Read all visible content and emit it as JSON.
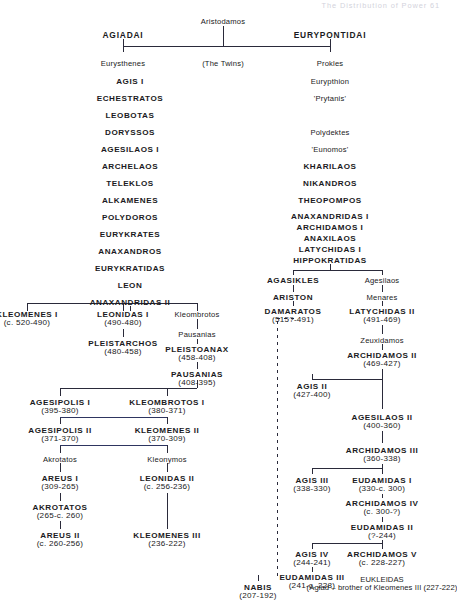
{
  "page": {
    "header": "The Distribution of Power   61"
  },
  "colors": {
    "ink": "#1a1a22",
    "line": "#2a2a3a",
    "blue_line": "#2e3560",
    "header": "#d3d3dc",
    "background": "#ffffff"
  },
  "nodes": [
    {
      "id": "aristodamos",
      "name": "Aristodamos",
      "dates": "",
      "x": 223,
      "y": 18,
      "style": "small"
    },
    {
      "id": "agiadai",
      "name": "AGIADAI",
      "dates": "",
      "x": 123,
      "y": 31,
      "style": "hdr"
    },
    {
      "id": "eurypontidai",
      "name": "EURYPONTIDAI",
      "dates": "",
      "x": 330,
      "y": 31,
      "style": "hdr"
    },
    {
      "id": "eurysthenes",
      "name": "Eurysthenes",
      "dates": "",
      "x": 123,
      "y": 60,
      "style": "small"
    },
    {
      "id": "the-twins",
      "name": "(The Twins)",
      "dates": "",
      "x": 223,
      "y": 60,
      "style": "small"
    },
    {
      "id": "prokles",
      "name": "Prokles",
      "dates": "",
      "x": 330,
      "y": 60,
      "style": "small"
    },
    {
      "id": "agis-i",
      "name": "AGIS I",
      "dates": "",
      "x": 130,
      "y": 78,
      "style": "caps"
    },
    {
      "id": "echestratos",
      "name": "ECHESTRATOS",
      "dates": "",
      "x": 130,
      "y": 95,
      "style": "caps"
    },
    {
      "id": "leobotas",
      "name": "LEOBOTAS",
      "dates": "",
      "x": 130,
      "y": 112,
      "style": "caps"
    },
    {
      "id": "doryssos",
      "name": "DORYSSOS",
      "dates": "",
      "x": 130,
      "y": 129,
      "style": "caps"
    },
    {
      "id": "agesilaos-i",
      "name": "AGESILAOS I",
      "dates": "",
      "x": 130,
      "y": 146,
      "style": "caps"
    },
    {
      "id": "archelaos",
      "name": "ARCHELAOS",
      "dates": "",
      "x": 130,
      "y": 163,
      "style": "caps"
    },
    {
      "id": "teleklos",
      "name": "TELEKLOS",
      "dates": "",
      "x": 130,
      "y": 180,
      "style": "caps"
    },
    {
      "id": "alkamenes",
      "name": "ALKAMENES",
      "dates": "",
      "x": 130,
      "y": 197,
      "style": "caps"
    },
    {
      "id": "polydoros",
      "name": "POLYDOROS",
      "dates": "",
      "x": 130,
      "y": 214,
      "style": "caps"
    },
    {
      "id": "eurykrates",
      "name": "EURYKRATES",
      "dates": "",
      "x": 130,
      "y": 231,
      "style": "caps"
    },
    {
      "id": "anaxandros",
      "name": "ANAXANDROS",
      "dates": "",
      "x": 130,
      "y": 248,
      "style": "caps"
    },
    {
      "id": "eurykratidas",
      "name": "EURYKRATIDAS",
      "dates": "",
      "x": 130,
      "y": 265,
      "style": "caps"
    },
    {
      "id": "leon",
      "name": "LEON",
      "dates": "",
      "x": 130,
      "y": 282,
      "style": "caps"
    },
    {
      "id": "anaxandridas-ii",
      "name": "ANAXANDRIDAS II",
      "dates": "",
      "x": 130,
      "y": 299,
      "style": "caps"
    },
    {
      "id": "eurypthion",
      "name": "Eurypthion",
      "dates": "",
      "x": 330,
      "y": 78,
      "style": "small"
    },
    {
      "id": "prytanis",
      "name": "'Prytanis'",
      "dates": "",
      "x": 330,
      "y": 95,
      "style": "small"
    },
    {
      "id": "polydektes",
      "name": "Polydektes",
      "dates": "",
      "x": 330,
      "y": 129,
      "style": "small"
    },
    {
      "id": "eunomos",
      "name": "'Eunomos'",
      "dates": "",
      "x": 330,
      "y": 146,
      "style": "small"
    },
    {
      "id": "kharilaos",
      "name": "KHARILAOS",
      "dates": "",
      "x": 330,
      "y": 163,
      "style": "caps"
    },
    {
      "id": "nikandros",
      "name": "NIKANDROS",
      "dates": "",
      "x": 330,
      "y": 180,
      "style": "caps"
    },
    {
      "id": "theopompos",
      "name": "THEOPOMPOS",
      "dates": "",
      "x": 330,
      "y": 197,
      "style": "caps"
    },
    {
      "id": "anaxandridas-i",
      "name": "ANAXANDRIDAS I",
      "dates": "",
      "x": 330,
      "y": 213,
      "style": "caps"
    },
    {
      "id": "archidamos-i",
      "name": "ARCHIDAMOS I",
      "dates": "",
      "x": 330,
      "y": 224,
      "style": "caps"
    },
    {
      "id": "anaxilaos",
      "name": "ANAXILAOS",
      "dates": "",
      "x": 330,
      "y": 235,
      "style": "caps"
    },
    {
      "id": "latychidas-i",
      "name": "LATYCHIDAS I",
      "dates": "",
      "x": 330,
      "y": 246,
      "style": "caps"
    },
    {
      "id": "hippokratidas",
      "name": "HIPPOKRATIDAS",
      "dates": "",
      "x": 330,
      "y": 257,
      "style": "caps"
    },
    {
      "id": "agasikles",
      "name": "AGASIKLES",
      "dates": "",
      "x": 293,
      "y": 277,
      "style": "caps"
    },
    {
      "id": "ariston",
      "name": "ARISTON",
      "dates": "",
      "x": 293,
      "y": 294,
      "style": "caps"
    },
    {
      "id": "damaratos",
      "name": "DAMARATOS",
      "dates": "(515?-491)",
      "x": 293,
      "y": 308,
      "style": "caps"
    },
    {
      "id": "agesilaos-r",
      "name": "Agesilaos",
      "dates": "",
      "x": 382,
      "y": 277,
      "style": "small"
    },
    {
      "id": "menares",
      "name": "Menares",
      "dates": "",
      "x": 382,
      "y": 294,
      "style": "small"
    },
    {
      "id": "latychidas-ii",
      "name": "LATYCHIDAS II",
      "dates": "(491-469)",
      "x": 382,
      "y": 308,
      "style": "caps"
    },
    {
      "id": "zeuxidamos",
      "name": "Zeuxidamos",
      "dates": "",
      "x": 382,
      "y": 337,
      "style": "small"
    },
    {
      "id": "archidamos-ii",
      "name": "ARCHIDAMOS II",
      "dates": "(469-427)",
      "x": 382,
      "y": 352,
      "style": "caps"
    },
    {
      "id": "agis-ii",
      "name": "AGIS II",
      "dates": "(427-400)",
      "x": 312,
      "y": 383,
      "style": "caps"
    },
    {
      "id": "agesilaos-ii",
      "name": "AGESILAOS II",
      "dates": "(400-360)",
      "x": 382,
      "y": 414,
      "style": "caps"
    },
    {
      "id": "archidamos-iii",
      "name": "ARCHIDAMOS III",
      "dates": "(360-338)",
      "x": 382,
      "y": 447,
      "style": "caps"
    },
    {
      "id": "agis-iii",
      "name": "AGIS III",
      "dates": "(338-330)",
      "x": 312,
      "y": 477,
      "style": "caps"
    },
    {
      "id": "eudamidas-i",
      "name": "EUDAMIDAS I",
      "dates": "(330-c. 300)",
      "x": 382,
      "y": 477,
      "style": "caps"
    },
    {
      "id": "archidamos-iv",
      "name": "ARCHIDAMOS IV",
      "dates": "(c. 300-?)",
      "x": 382,
      "y": 500,
      "style": "caps"
    },
    {
      "id": "eudamidas-ii",
      "name": "EUDAMIDAS II",
      "dates": "(?-244)",
      "x": 382,
      "y": 524,
      "style": "caps"
    },
    {
      "id": "agis-iv",
      "name": "AGIS IV",
      "dates": "(244-241)",
      "x": 312,
      "y": 551,
      "style": "caps"
    },
    {
      "id": "archidamos-v",
      "name": "ARCHIDAMOS V",
      "dates": "(c. 228-227)",
      "x": 382,
      "y": 551,
      "style": "caps"
    },
    {
      "id": "eudamidas-iii",
      "name": "EUDAMIDAS III",
      "dates": "(241-c. 228)",
      "x": 312,
      "y": 574,
      "style": "caps"
    },
    {
      "id": "eukleidas",
      "name": "EUKLEIDAS",
      "dates": "(Agiad – brother of Kleomenes III (227-222)",
      "x": 382,
      "y": 576,
      "style": "multi"
    },
    {
      "id": "nabis",
      "name": "NABIS",
      "dates": "(207-192)",
      "x": 258,
      "y": 584,
      "style": "caps"
    },
    {
      "id": "kleomenes-i",
      "name": "KLEOMENES I",
      "dates": "(c. 520-490)",
      "x": 27,
      "y": 311,
      "style": "caps"
    },
    {
      "id": "leonidas-i",
      "name": "LEONIDAS I",
      "dates": "(490-480)",
      "x": 123,
      "y": 311,
      "style": "caps"
    },
    {
      "id": "kleombrotos",
      "name": "Kleombrotos",
      "dates": "",
      "x": 197,
      "y": 311,
      "style": "small"
    },
    {
      "id": "pleistarchos",
      "name": "PLEISTARCHOS",
      "dates": "(480-458)",
      "x": 123,
      "y": 340,
      "style": "caps"
    },
    {
      "id": "pausanias-1",
      "name": "Pausanias",
      "dates": "",
      "x": 197,
      "y": 331,
      "style": "small"
    },
    {
      "id": "pleistoanax",
      "name": "PLEISTOANAX",
      "dates": "(458-408)",
      "x": 197,
      "y": 346,
      "style": "caps"
    },
    {
      "id": "pausanias-2",
      "name": "PAUSANIAS",
      "dates": "(408-395)",
      "x": 197,
      "y": 371,
      "style": "caps"
    },
    {
      "id": "agesipolis-i",
      "name": "AGESIPOLIS I",
      "dates": "(395-380)",
      "x": 60,
      "y": 399,
      "style": "caps"
    },
    {
      "id": "kleombrotos-i",
      "name": "KLEOMBROTOS I",
      "dates": "(380-371)",
      "x": 167,
      "y": 399,
      "style": "caps"
    },
    {
      "id": "agesipolis-ii",
      "name": "AGESIPOLIS II",
      "dates": "(371-370)",
      "x": 60,
      "y": 427,
      "style": "caps"
    },
    {
      "id": "kleomenes-ii",
      "name": "KLEOMENES II",
      "dates": "(370-309)",
      "x": 167,
      "y": 427,
      "style": "caps"
    },
    {
      "id": "akrotatos-l",
      "name": "Akrotatos",
      "dates": "",
      "x": 60,
      "y": 456,
      "style": "small"
    },
    {
      "id": "kleonymos",
      "name": "Kleonymos",
      "dates": "",
      "x": 167,
      "y": 456,
      "style": "small"
    },
    {
      "id": "areus-i",
      "name": "AREUS I",
      "dates": "(309-265)",
      "x": 60,
      "y": 475,
      "style": "caps"
    },
    {
      "id": "leonidas-ii",
      "name": "LEONIDAS II",
      "dates": "(c. 256-236)",
      "x": 167,
      "y": 475,
      "style": "caps"
    },
    {
      "id": "akrotatos",
      "name": "AKROTATOS",
      "dates": "(265-c. 260)",
      "x": 60,
      "y": 504,
      "style": "caps"
    },
    {
      "id": "areus-ii",
      "name": "AREUS II",
      "dates": "(c. 260-256)",
      "x": 60,
      "y": 532,
      "style": "caps"
    },
    {
      "id": "kleomenes-iii",
      "name": "KLEOMENES III",
      "dates": "(236-222)",
      "x": 167,
      "y": 532,
      "style": "caps"
    }
  ],
  "connectors": {
    "solid_vertical": [
      {
        "id": "aristodamos-down",
        "x": 223,
        "y": 26,
        "h": 20
      },
      {
        "id": "agiadai-down",
        "x": 123,
        "y": 39,
        "h": 7
      },
      {
        "id": "eurypontidai-down",
        "x": 330,
        "y": 39,
        "h": 7
      },
      {
        "id": "sib-left-down",
        "x": 123,
        "y": 46,
        "h": 6
      },
      {
        "id": "sib-right-down",
        "x": 330,
        "y": 46,
        "h": 6
      },
      {
        "id": "anax-ii-down",
        "x": 130,
        "y": 306,
        "h": 5
      },
      {
        "id": "branch-l-down",
        "x": 27,
        "y": 303,
        "h": 8
      },
      {
        "id": "branch-m-down",
        "x": 123,
        "y": 303,
        "h": 8
      },
      {
        "id": "branch-r-down",
        "x": 197,
        "y": 303,
        "h": 8
      },
      {
        "id": "leonidas-pleist",
        "x": 123,
        "y": 329,
        "h": 8
      },
      {
        "id": "kleom-paus",
        "x": 197,
        "y": 319,
        "h": 10
      },
      {
        "id": "paus-pleisto",
        "x": 197,
        "y": 339,
        "h": 5
      },
      {
        "id": "pleisto-paus2",
        "x": 197,
        "y": 362,
        "h": 7
      },
      {
        "id": "paus2-branch",
        "x": 197,
        "y": 380,
        "h": 8
      },
      {
        "id": "ag1-up",
        "x": 60,
        "y": 388,
        "h": 8
      },
      {
        "id": "kl1-up",
        "x": 167,
        "y": 388,
        "h": 8
      },
      {
        "id": "ag1-down",
        "x": 60,
        "y": 417,
        "h": 7
      },
      {
        "id": "kl1-down",
        "x": 167,
        "y": 417,
        "h": 7
      },
      {
        "id": "ag2-down",
        "x": 60,
        "y": 445,
        "h": 8
      },
      {
        "id": "kl2-down",
        "x": 167,
        "y": 445,
        "h": 8
      },
      {
        "id": "akro-areus",
        "x": 60,
        "y": 463,
        "h": 9
      },
      {
        "id": "kleon-leon2",
        "x": 167,
        "y": 463,
        "h": 9
      },
      {
        "id": "areus-akro",
        "x": 60,
        "y": 493,
        "h": 8
      },
      {
        "id": "akro-areus2",
        "x": 60,
        "y": 521,
        "h": 8
      },
      {
        "id": "leon2-kleo3",
        "x": 167,
        "y": 493,
        "h": 36
      },
      {
        "id": "hippo-down",
        "x": 330,
        "y": 264,
        "h": 6
      },
      {
        "id": "agasikles-down",
        "x": 293,
        "y": 270,
        "h": 5
      },
      {
        "id": "agesilaos-down",
        "x": 382,
        "y": 270,
        "h": 5
      },
      {
        "id": "agas-ariston",
        "x": 293,
        "y": 285,
        "h": 7
      },
      {
        "id": "ariston-dam",
        "x": 293,
        "y": 301,
        "h": 5
      },
      {
        "id": "ages-menares",
        "x": 382,
        "y": 285,
        "h": 7
      },
      {
        "id": "men-laty2",
        "x": 382,
        "y": 301,
        "h": 5
      },
      {
        "id": "laty2-zeux",
        "x": 382,
        "y": 325,
        "h": 9
      },
      {
        "id": "zeux-arch2",
        "x": 382,
        "y": 344,
        "h": 6
      },
      {
        "id": "arch2-branch",
        "x": 382,
        "y": 369,
        "h": 10
      },
      {
        "id": "agis2-up",
        "x": 312,
        "y": 374,
        "h": 6
      },
      {
        "id": "ages2-up",
        "x": 382,
        "y": 379,
        "h": 30
      },
      {
        "id": "ages2-arch3",
        "x": 382,
        "y": 431,
        "h": 12
      },
      {
        "id": "arch3-branch",
        "x": 382,
        "y": 464,
        "h": 7
      },
      {
        "id": "agis3-up",
        "x": 312,
        "y": 468,
        "h": 6
      },
      {
        "id": "eud1-up",
        "x": 382,
        "y": 468,
        "h": 6
      },
      {
        "id": "eud1-arch4",
        "x": 382,
        "y": 494,
        "h": 4
      },
      {
        "id": "arch4-eud2",
        "x": 382,
        "y": 517,
        "h": 5
      },
      {
        "id": "eud2-branch",
        "x": 382,
        "y": 540,
        "h": 5
      },
      {
        "id": "agis4-up",
        "x": 312,
        "y": 543,
        "h": 6
      },
      {
        "id": "arch5-up",
        "x": 382,
        "y": 543,
        "h": 6
      },
      {
        "id": "agis4-eud3",
        "x": 312,
        "y": 567,
        "h": 5
      },
      {
        "id": "nabis-up",
        "x": 258,
        "y": 575,
        "h": 6
      }
    ],
    "solid_horizontal": [
      {
        "id": "twins-bar",
        "x": 123,
        "y": 46,
        "w": 207
      },
      {
        "id": "anax-split",
        "x": 27,
        "y": 303,
        "w": 170
      },
      {
        "id": "paus2-split",
        "x": 60,
        "y": 388,
        "w": 137
      },
      {
        "id": "ages1-split",
        "x": 60,
        "y": 417,
        "w": 107
      },
      {
        "id": "ages2-split",
        "x": 60,
        "y": 445,
        "w": 107
      },
      {
        "id": "hippo-split",
        "x": 293,
        "y": 270,
        "w": 89
      },
      {
        "id": "arch2-split",
        "x": 312,
        "y": 379,
        "w": 70
      },
      {
        "id": "arch3-split",
        "x": 312,
        "y": 468,
        "w": 70
      },
      {
        "id": "eud2-split",
        "x": 312,
        "y": 543,
        "w": 70
      }
    ],
    "dashed_vertical": [
      {
        "id": "damaratos-dashed",
        "x": 277,
        "y": 321,
        "h": 255
      }
    ],
    "dashed_horizontal": [
      {
        "id": "damaratos-dash-top",
        "x": 277,
        "y": 318,
        "w": 18
      }
    ],
    "blue_horizontal": [
      {
        "id": "blue-agesipolis",
        "x": 60,
        "y": 417,
        "w": 107
      },
      {
        "id": "blue-agesipolis2",
        "x": 60,
        "y": 445,
        "w": 107
      }
    ]
  }
}
